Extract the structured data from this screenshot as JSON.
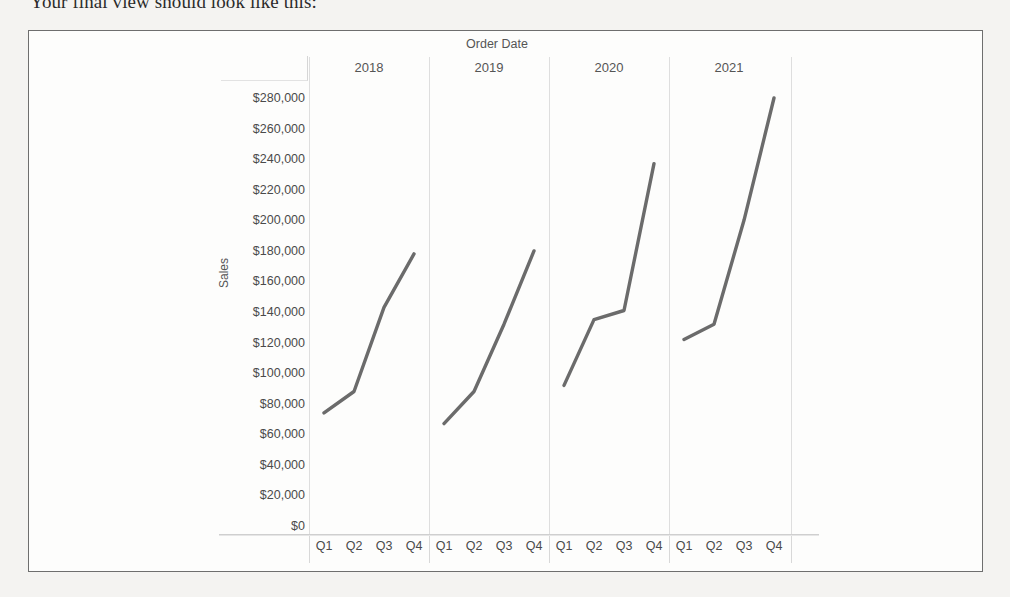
{
  "page": {
    "caption": "Your final view should look like this:"
  },
  "chart_data": {
    "type": "line",
    "title": "",
    "xlabel": "Order Date",
    "ylabel": "Sales",
    "column_header_label": "Order Date",
    "ylim": [
      0,
      280000
    ],
    "ytick_labels": [
      "$280,000",
      "$260,000",
      "$240,000",
      "$220,000",
      "$200,000",
      "$180,000",
      "$160,000",
      "$140,000",
      "$120,000",
      "$100,000",
      "$80,000",
      "$60,000",
      "$40,000",
      "$20,000",
      "$0"
    ],
    "ytick_values": [
      280000,
      260000,
      240000,
      220000,
      200000,
      180000,
      160000,
      140000,
      120000,
      100000,
      80000,
      60000,
      40000,
      20000,
      0
    ],
    "grid": false,
    "legend": "none",
    "panels": [
      {
        "year": "2018",
        "categories": [
          "Q1",
          "Q2",
          "Q3",
          "Q4"
        ],
        "values": [
          74000,
          88000,
          143000,
          178000
        ]
      },
      {
        "year": "2019",
        "categories": [
          "Q1",
          "Q2",
          "Q3",
          "Q4"
        ],
        "values": [
          67000,
          88000,
          132000,
          180000
        ]
      },
      {
        "year": "2020",
        "categories": [
          "Q1",
          "Q2",
          "Q3",
          "Q4"
        ],
        "values": [
          92000,
          135000,
          141000,
          237000
        ]
      },
      {
        "year": "2021",
        "categories": [
          "Q1",
          "Q2",
          "Q3",
          "Q4"
        ],
        "values": [
          122000,
          132000,
          200000,
          280000
        ]
      }
    ],
    "colors": {
      "line": "#6b6b6b",
      "axis_text": "#4a4a4a",
      "header_text": "#555555",
      "divider": "#dedede",
      "frame": "#6e6e6e",
      "background": "#fdfdfc"
    }
  }
}
